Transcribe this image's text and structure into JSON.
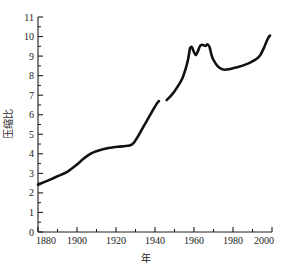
{
  "chart_data": {
    "type": "line",
    "title": "",
    "xlabel": "年",
    "ylabel": "压缩比",
    "xlim": [
      1880,
      2000
    ],
    "ylim": [
      0,
      11
    ],
    "grid": false,
    "legend": null,
    "x_ticks": [
      1880,
      1900,
      1920,
      1940,
      1960,
      1980,
      2000
    ],
    "x_tick_labels": [
      "1880",
      "1900",
      "1920",
      "1940",
      "1960",
      "1980",
      "2000"
    ],
    "x_minor_ticks": [
      1890,
      1910,
      1930,
      1950,
      1970,
      1990
    ],
    "y_ticks": [
      0,
      1,
      2,
      3,
      4,
      5,
      6,
      7,
      8,
      9,
      10,
      11
    ],
    "y_tick_labels": [
      "0",
      "1",
      "2",
      "3",
      "4",
      "5",
      "6",
      "7",
      "8",
      "9",
      "10",
      "11"
    ],
    "y_minor_ticks": [
      0.5,
      1.5,
      2.5,
      3.5,
      4.5,
      5.5,
      6.5,
      7.5,
      8.5,
      9.5,
      10.5
    ],
    "series": [
      {
        "name": "压缩比",
        "color": "#111111",
        "segments": [
          {
            "label": "1880-1942",
            "x": [
              1880,
              1885,
              1890,
              1895,
              1900,
              1903,
              1906,
              1909,
              1912,
              1915,
              1918,
              1921,
              1924,
              1927,
              1929,
              1931,
              1933,
              1935,
              1937,
              1939,
              1941,
              1942
            ],
            "y": [
              2.42,
              2.63,
              2.85,
              3.08,
              3.45,
              3.72,
              3.95,
              4.1,
              4.2,
              4.27,
              4.32,
              4.36,
              4.39,
              4.42,
              4.55,
              4.85,
              5.2,
              5.55,
              5.9,
              6.25,
              6.58,
              6.7
            ]
          },
          {
            "label": "1946-1999",
            "x": [
              1946,
              1948,
              1950,
              1952,
              1954,
              1956,
              1957,
              1958,
              1959,
              1960,
              1961,
              1962,
              1963,
              1964,
              1965,
              1966,
              1967,
              1968,
              1969,
              1970,
              1972,
              1974,
              1976,
              1978,
              1980,
              1983,
              1986,
              1989,
              1992,
              1994,
              1996,
              1997,
              1998,
              1999
            ],
            "y": [
              6.75,
              6.95,
              7.2,
              7.5,
              7.85,
              8.45,
              8.85,
              9.4,
              9.45,
              9.2,
              9.05,
              9.25,
              9.5,
              9.58,
              9.55,
              9.52,
              9.6,
              9.45,
              9.05,
              8.8,
              8.5,
              8.35,
              8.3,
              8.33,
              8.38,
              8.45,
              8.55,
              8.68,
              8.85,
              9.05,
              9.45,
              9.7,
              9.92,
              10.05
            ]
          }
        ],
        "gap_years": [
          1942,
          1946
        ],
        "start_value": 2.42,
        "end_value": 10.05,
        "peak_values": [
          9.45,
          9.6
        ],
        "peak_years": [
          1959,
          1967
        ],
        "min_value": 2.42,
        "max_value": 10.05
      }
    ]
  },
  "axes": {
    "y_title": "压缩比",
    "x_title": "年"
  }
}
